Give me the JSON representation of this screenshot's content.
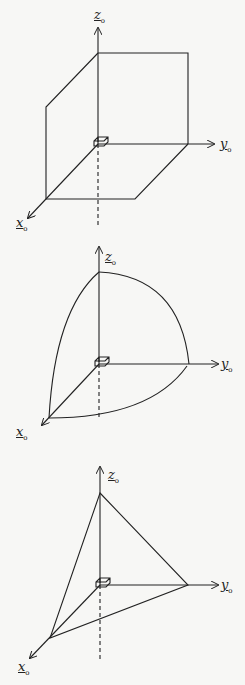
{
  "figures": [
    {
      "name": "plane-region",
      "labels": {
        "z": "z",
        "y": "y",
        "x": "x",
        "subscript": "o"
      }
    },
    {
      "name": "spherical-octant",
      "labels": {
        "z": "z",
        "y": "y",
        "x": "x",
        "subscript": "o"
      }
    },
    {
      "name": "triangular-plane",
      "labels": {
        "z": "z",
        "y": "y",
        "x": "x",
        "subscript": "o"
      }
    }
  ],
  "colors": {
    "ink": "#222222",
    "paper": "#f7f7f5"
  }
}
